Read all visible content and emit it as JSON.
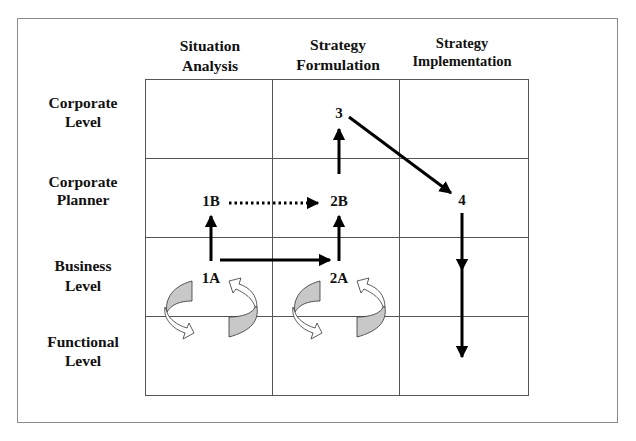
{
  "diagram": {
    "columns": [
      {
        "line1": "Situation",
        "line2": "Analysis"
      },
      {
        "line1": "Strategy",
        "line2": "Formulation"
      },
      {
        "line1": "Strategy",
        "line2": "Implementation"
      }
    ],
    "rows": [
      {
        "line1": "Corporate",
        "line2": "Level"
      },
      {
        "line1": "Corporate",
        "line2": "Planner"
      },
      {
        "line1": "Business",
        "line2": "Level"
      },
      {
        "line1": "Functional",
        "line2": "Level"
      }
    ],
    "nodes": {
      "n1A": "1A",
      "n1B": "1B",
      "n2A": "2A",
      "n2B": "2B",
      "n3": "3",
      "n4": "4"
    },
    "edges": [
      {
        "from": "1A",
        "to": "1B",
        "style": "solid"
      },
      {
        "from": "1A",
        "to": "2A",
        "style": "solid"
      },
      {
        "from": "1B",
        "to": "2B",
        "style": "dotted"
      },
      {
        "from": "2A",
        "to": "2B",
        "style": "solid"
      },
      {
        "from": "2B",
        "to": "3",
        "style": "solid"
      },
      {
        "from": "3",
        "to": "4",
        "style": "solid"
      },
      {
        "from": "4",
        "to": "Business Level",
        "style": "solid"
      },
      {
        "from": "Business Level",
        "to": "Functional Level",
        "style": "solid"
      }
    ],
    "cycle_icons": [
      "situation-analysis-business-functional",
      "strategy-formulation-business-functional"
    ],
    "colors": {
      "frame": "#8a8a8a",
      "grid": "#555555",
      "arrow": "#000000",
      "cycle_fill": "#c8c8c8"
    }
  }
}
